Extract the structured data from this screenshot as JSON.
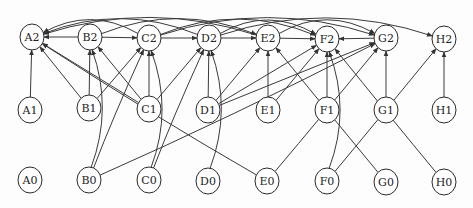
{
  "diagram": {
    "type": "directed-graph",
    "layers": [
      "2",
      "1",
      "0"
    ],
    "columns": [
      "A",
      "B",
      "C",
      "D",
      "E",
      "F",
      "G",
      "H"
    ],
    "nodes": [
      {
        "id": "A2",
        "label": "A2",
        "x": 32,
        "y": 37
      },
      {
        "id": "B2",
        "label": "B2",
        "x": 90,
        "y": 37
      },
      {
        "id": "C2",
        "label": "C2",
        "x": 149,
        "y": 38
      },
      {
        "id": "D2",
        "label": "D2",
        "x": 209,
        "y": 38
      },
      {
        "id": "E2",
        "label": "E2",
        "x": 268,
        "y": 38
      },
      {
        "id": "F2",
        "label": "F2",
        "x": 327,
        "y": 39
      },
      {
        "id": "G2",
        "label": "G2",
        "x": 386,
        "y": 38
      },
      {
        "id": "H2",
        "label": "H2",
        "x": 444,
        "y": 39
      },
      {
        "id": "A1",
        "label": "A1",
        "x": 30,
        "y": 110
      },
      {
        "id": "B1",
        "label": "B1",
        "x": 89,
        "y": 108
      },
      {
        "id": "C1",
        "label": "C1",
        "x": 149,
        "y": 109
      },
      {
        "id": "D1",
        "label": "D1",
        "x": 208,
        "y": 110
      },
      {
        "id": "E1",
        "label": "E1",
        "x": 268,
        "y": 110
      },
      {
        "id": "F1",
        "label": "F1",
        "x": 327,
        "y": 110
      },
      {
        "id": "G1",
        "label": "G1",
        "x": 386,
        "y": 110
      },
      {
        "id": "H1",
        "label": "H1",
        "x": 444,
        "y": 110
      },
      {
        "id": "A0",
        "label": "A0",
        "x": 30,
        "y": 180
      },
      {
        "id": "B0",
        "label": "B0",
        "x": 89,
        "y": 180
      },
      {
        "id": "C0",
        "label": "C0",
        "x": 149,
        "y": 180
      },
      {
        "id": "D0",
        "label": "D0",
        "x": 208,
        "y": 181
      },
      {
        "id": "E0",
        "label": "E0",
        "x": 267,
        "y": 181
      },
      {
        "id": "F0",
        "label": "F0",
        "x": 327,
        "y": 181
      },
      {
        "id": "G0",
        "label": "G0",
        "x": 386,
        "y": 182
      },
      {
        "id": "H0",
        "label": "H0",
        "x": 444,
        "y": 182
      }
    ],
    "edges": [
      {
        "from": "B2",
        "to": "A2"
      },
      {
        "from": "B2",
        "to": "C2"
      },
      {
        "from": "C2",
        "to": "D2"
      },
      {
        "from": "D2",
        "to": "E2"
      },
      {
        "from": "E2",
        "to": "F2"
      },
      {
        "from": "G2",
        "to": "F2"
      },
      {
        "from": "A1",
        "to": "A2"
      },
      {
        "from": "B1",
        "to": "B2"
      },
      {
        "from": "B1",
        "to": "A2"
      },
      {
        "from": "B1",
        "to": "C2"
      },
      {
        "from": "C1",
        "to": "C2"
      },
      {
        "from": "C1",
        "to": "B2"
      },
      {
        "from": "C1",
        "to": "A2"
      },
      {
        "from": "C1",
        "to": "D2"
      },
      {
        "from": "D1",
        "to": "D2"
      },
      {
        "from": "D1",
        "to": "E2"
      },
      {
        "from": "D1",
        "to": "F2"
      },
      {
        "from": "D1",
        "to": "G2"
      },
      {
        "from": "E1",
        "to": "E2"
      },
      {
        "from": "E1",
        "to": "F2"
      },
      {
        "from": "F1",
        "to": "F2"
      },
      {
        "from": "G1",
        "to": "G2"
      },
      {
        "from": "H1",
        "to": "H2"
      },
      {
        "from": "B0",
        "to": "B2"
      },
      {
        "from": "B0",
        "to": "C2"
      },
      {
        "from": "B0",
        "to": "G2"
      },
      {
        "from": "C0",
        "to": "C2"
      },
      {
        "from": "C0",
        "to": "D2"
      },
      {
        "from": "D0",
        "to": "D2"
      },
      {
        "from": "E0",
        "to": "A2"
      },
      {
        "from": "E0",
        "to": "G2"
      },
      {
        "from": "F0",
        "to": "F2"
      },
      {
        "from": "F0",
        "to": "H2"
      },
      {
        "from": "G0",
        "to": "E2"
      },
      {
        "from": "H0",
        "to": "F2"
      },
      {
        "from": "C2",
        "to": "A2"
      },
      {
        "from": "D2",
        "to": "A2"
      },
      {
        "from": "E2",
        "to": "A2"
      },
      {
        "from": "B2",
        "to": "E2"
      },
      {
        "from": "C2",
        "to": "F2"
      },
      {
        "from": "D2",
        "to": "F2"
      },
      {
        "from": "C2",
        "to": "G2"
      },
      {
        "from": "E2",
        "to": "G2"
      },
      {
        "from": "D2",
        "to": "H2"
      }
    ]
  }
}
